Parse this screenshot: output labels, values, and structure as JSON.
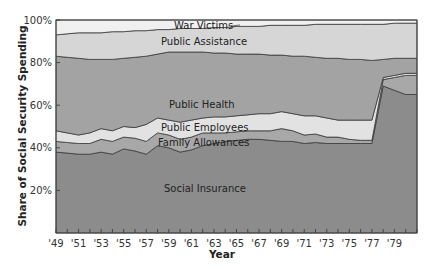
{
  "chart_data": {
    "type": "area",
    "stacked": true,
    "title": "",
    "xlabel": "Year",
    "ylabel": "Share of Social Security Spending",
    "ylim": [
      0,
      100
    ],
    "xlim": [
      1949,
      1981
    ],
    "y_ticks": [
      "20%",
      "40%",
      "60%",
      "80%",
      "100%"
    ],
    "x_ticks": [
      "'49",
      "'51",
      "'53",
      "'55",
      "'57",
      "'59",
      "'61",
      "'63",
      "'65",
      "'67",
      "'69",
      "'71",
      "'73",
      "'75",
      "'77",
      "'79"
    ],
    "x": [
      1949,
      1950,
      1951,
      1952,
      1953,
      1954,
      1955,
      1956,
      1957,
      1958,
      1959,
      1960,
      1961,
      1962,
      1963,
      1964,
      1965,
      1966,
      1967,
      1968,
      1969,
      1970,
      1971,
      1972,
      1973,
      1974,
      1975,
      1976,
      1977,
      1978,
      1979,
      1980,
      1981
    ],
    "series_cumulative_top": [
      {
        "name": "Social Insurance",
        "values": [
          38,
          37.5,
          37,
          37,
          38,
          37,
          39.5,
          38.5,
          37,
          41,
          40,
          38,
          39,
          41,
          42,
          43,
          43.5,
          44,
          44,
          43.5,
          43,
          43,
          42,
          42.5,
          42,
          42,
          42,
          42,
          42,
          69,
          67,
          65,
          65
        ]
      },
      {
        "name": "Family Allowances",
        "values": [
          43,
          42.5,
          42,
          42,
          44,
          43,
          45,
          44.5,
          43,
          47,
          46,
          44,
          45,
          47,
          47,
          47,
          47.5,
          48,
          48,
          48,
          49,
          48,
          46,
          46.5,
          45,
          45,
          44,
          43.5,
          43.5,
          72,
          73,
          74,
          74
        ]
      },
      {
        "name": "Public Employees",
        "values": [
          48,
          47,
          46,
          47,
          49,
          48,
          50,
          49.5,
          51,
          54,
          53,
          52,
          53,
          54,
          54.5,
          54.5,
          55,
          55.5,
          56,
          56,
          57,
          56,
          55,
          55,
          54,
          53,
          53,
          53,
          53,
          73,
          74,
          75,
          75
        ]
      },
      {
        "name": "Public Health",
        "values": [
          83,
          82.5,
          82,
          81.5,
          81.5,
          81.5,
          82,
          82.5,
          83,
          84,
          85,
          85,
          85,
          85,
          84.5,
          84.5,
          84,
          84,
          84,
          83.5,
          83.5,
          83,
          83,
          82.5,
          82,
          82,
          81.5,
          81.5,
          81,
          81.5,
          82,
          82,
          82
        ]
      },
      {
        "name": "Public Assistance",
        "values": [
          93,
          93.5,
          94,
          94,
          94,
          94.5,
          94.5,
          95,
          95,
          95.5,
          95.5,
          96,
          96,
          96,
          96.5,
          96.5,
          97,
          97,
          97,
          97.5,
          97.5,
          97.5,
          97.5,
          98,
          98,
          98,
          98,
          98,
          98,
          98,
          98.5,
          98.5,
          98.5
        ]
      },
      {
        "name": "War Victims",
        "values": [
          100,
          100,
          100,
          100,
          100,
          100,
          100,
          100,
          100,
          100,
          100,
          100,
          100,
          100,
          100,
          100,
          100,
          100,
          100,
          100,
          100,
          100,
          100,
          100,
          100,
          100,
          100,
          100,
          100,
          100,
          100,
          100,
          100
        ]
      }
    ],
    "annotations": [
      "War Victims",
      "Public Assistance",
      "Public Health",
      "Public Employees",
      "Family Allowances",
      "Social Insurance"
    ],
    "colors": [
      "#8c8c8c",
      "#a8a8a8",
      "#e2e2e2",
      "#a3a3a3",
      "#d6d6d6",
      "#f0f0f0"
    ]
  },
  "labels": {
    "war_victims": "War Victims",
    "public_assistance": "Public Assistance",
    "public_health": "Public Health",
    "public_employees": "Public Employees",
    "family_allowances": "Family Allowances",
    "social_insurance": "Social Insurance"
  },
  "axes": {
    "ylabel": "Share of Social Security Spending",
    "xlabel": "Year",
    "y_ticks": [
      {
        "v": 20,
        "t": "20%"
      },
      {
        "v": 40,
        "t": "40%"
      },
      {
        "v": 60,
        "t": "60%"
      },
      {
        "v": 80,
        "t": "80%"
      },
      {
        "v": 100,
        "t": "100%"
      }
    ]
  }
}
